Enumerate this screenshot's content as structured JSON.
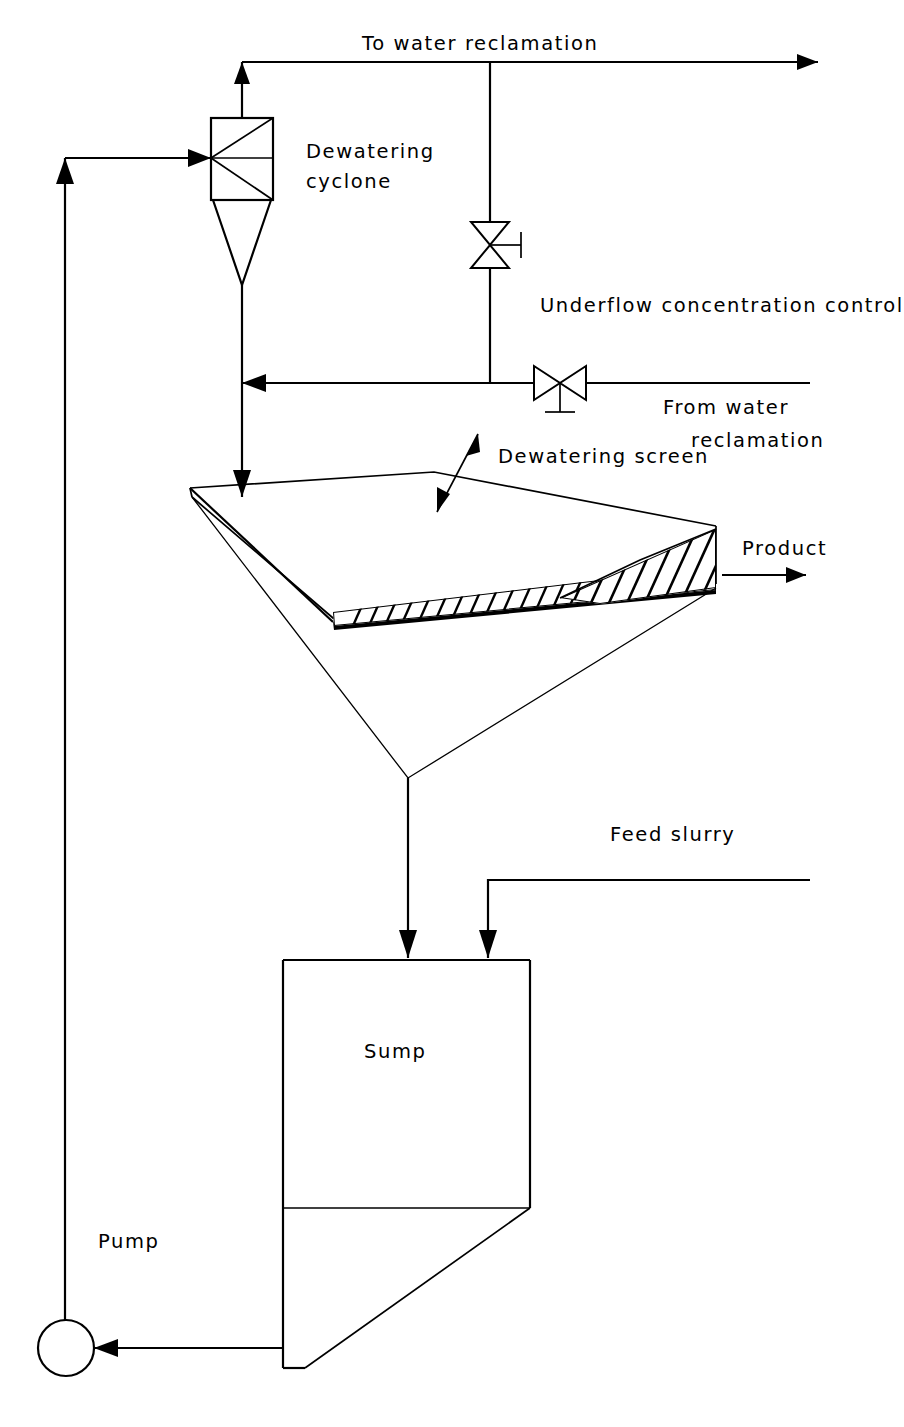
{
  "diagram": {
    "type": "process-flow-diagram",
    "background_color": "#ffffff",
    "line_color": "#000000"
  },
  "labels": {
    "to_water_reclamation": "To water reclamation",
    "dewatering_cyclone_line1": "Dewatering",
    "dewatering_cyclone_line2": "cyclone",
    "underflow_concentration_control": "Underflow concentration control",
    "from_water_line1": "From water",
    "from_water_line2": "reclamation",
    "dewatering_screen": "Dewatering screen",
    "product": "Product",
    "feed_slurry": "Feed slurry",
    "sump": "Sump",
    "pump": "Pump"
  },
  "equipment": [
    {
      "id": "dewatering-cyclone",
      "label": "Dewatering cyclone",
      "kind": "hydrocyclone"
    },
    {
      "id": "dewatering-screen",
      "label": "Dewatering screen",
      "kind": "vibrating-screen"
    },
    {
      "id": "sump",
      "label": "Sump",
      "kind": "tank"
    },
    {
      "id": "pump",
      "label": "Pump",
      "kind": "centrifugal-pump"
    },
    {
      "id": "underflow-concentration-control-valve",
      "label": "Underflow concentration control",
      "kind": "control-valve"
    },
    {
      "id": "water-supply-valve",
      "label": "From water reclamation",
      "kind": "control-valve"
    }
  ],
  "streams": [
    {
      "id": "cyclone-overflow",
      "label": "To water reclamation",
      "direction": "out"
    },
    {
      "id": "water-addition",
      "label": "From water reclamation",
      "direction": "in"
    },
    {
      "id": "screen-product",
      "label": "Product",
      "direction": "out"
    },
    {
      "id": "feed-slurry",
      "label": "Feed slurry",
      "direction": "in"
    },
    {
      "id": "pump-discharge",
      "label": "",
      "direction": "internal"
    },
    {
      "id": "cyclone-underflow",
      "label": "",
      "direction": "internal"
    },
    {
      "id": "screen-underflow",
      "label": "",
      "direction": "internal"
    },
    {
      "id": "sump-suction",
      "label": "",
      "direction": "internal"
    }
  ]
}
